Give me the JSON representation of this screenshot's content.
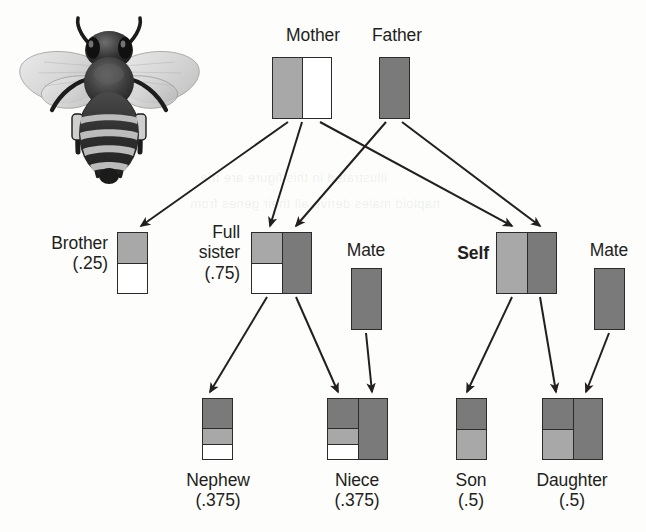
{
  "figure": {
    "background_color": "#fdfdfc",
    "line_color": "#231f20"
  },
  "palette": {
    "white": "#ffffff",
    "light_gray": "#a8a8a8",
    "dark_gray": "#7a7a7a",
    "outline": "#2b2b2b"
  },
  "ghost_text": [
    {
      "text": "illustrated in this figure are the",
      "x": 200,
      "y": 170
    },
    {
      "text": "haploid males derive all their genes from",
      "x": 190,
      "y": 196
    }
  ],
  "bee": {
    "name": "honeybee-illustration",
    "alt": "Grayscale honeybee viewed from above with wings spread"
  },
  "nodes": [
    {
      "id": "mother",
      "label": "Mother",
      "coefficient": "",
      "bold": false,
      "label_x": 313,
      "label_y": 25,
      "label_align": "center",
      "block_x": 272,
      "block_y": 57,
      "block_w": 60,
      "block_h": 62,
      "columns": [
        {
          "cells": [
            {
              "fill": "light_gray",
              "frac": 1
            }
          ]
        },
        {
          "cells": [
            {
              "fill": "white",
              "frac": 1
            }
          ]
        }
      ]
    },
    {
      "id": "father",
      "label": "Father",
      "coefficient": "",
      "bold": false,
      "label_x": 397,
      "label_y": 25,
      "label_align": "center",
      "block_x": 379,
      "block_y": 57,
      "block_w": 31,
      "block_h": 62,
      "columns": [
        {
          "cells": [
            {
              "fill": "dark_gray",
              "frac": 1
            }
          ]
        }
      ]
    },
    {
      "id": "brother",
      "label": "Brother",
      "coefficient": "(.25)",
      "bold": false,
      "label_x": 108,
      "label_y": 233,
      "label_align": "right",
      "block_x": 117,
      "block_y": 232,
      "block_w": 31,
      "block_h": 62,
      "columns": [
        {
          "cells": [
            {
              "fill": "light_gray",
              "frac": 0.5
            },
            {
              "fill": "white",
              "frac": 0.5
            }
          ]
        }
      ]
    },
    {
      "id": "full-sister",
      "label": "Full\nsister",
      "coefficient": "(.75)",
      "bold": false,
      "label_x": 240,
      "label_y": 222,
      "label_align": "right",
      "block_x": 251,
      "block_y": 232,
      "block_w": 61,
      "block_h": 62,
      "columns": [
        {
          "cells": [
            {
              "fill": "light_gray",
              "frac": 0.5
            },
            {
              "fill": "white",
              "frac": 0.5
            }
          ]
        },
        {
          "cells": [
            {
              "fill": "dark_gray",
              "frac": 1
            }
          ]
        }
      ]
    },
    {
      "id": "mate-left",
      "label": "Mate",
      "coefficient": "",
      "bold": false,
      "label_x": 366,
      "label_y": 240,
      "label_align": "center",
      "block_x": 351,
      "block_y": 268,
      "block_w": 31,
      "block_h": 62,
      "columns": [
        {
          "cells": [
            {
              "fill": "dark_gray",
              "frac": 1
            }
          ]
        }
      ]
    },
    {
      "id": "self",
      "label": "Self",
      "coefficient": "",
      "bold": true,
      "label_x": 489,
      "label_y": 243,
      "label_align": "right",
      "block_x": 496,
      "block_y": 232,
      "block_w": 61,
      "block_h": 62,
      "columns": [
        {
          "cells": [
            {
              "fill": "light_gray",
              "frac": 1
            }
          ]
        },
        {
          "cells": [
            {
              "fill": "dark_gray",
              "frac": 1
            }
          ]
        }
      ]
    },
    {
      "id": "mate-right",
      "label": "Mate",
      "coefficient": "",
      "bold": false,
      "label_x": 609,
      "label_y": 240,
      "label_align": "center",
      "block_x": 594,
      "block_y": 268,
      "block_w": 31,
      "block_h": 62,
      "columns": [
        {
          "cells": [
            {
              "fill": "dark_gray",
              "frac": 1
            }
          ]
        }
      ]
    },
    {
      "id": "nephew",
      "label": "Nephew",
      "coefficient": "(.375)",
      "bold": false,
      "label_x": 218,
      "label_y": 470,
      "label_align": "center",
      "block_x": 202,
      "block_y": 398,
      "block_w": 31,
      "block_h": 62,
      "columns": [
        {
          "cells": [
            {
              "fill": "dark_gray",
              "frac": 0.5
            },
            {
              "fill": "light_gray",
              "frac": 0.25
            },
            {
              "fill": "white",
              "frac": 0.25
            }
          ]
        }
      ]
    },
    {
      "id": "niece",
      "label": "Niece",
      "coefficient": "(.375)",
      "bold": false,
      "label_x": 357,
      "label_y": 470,
      "label_align": "center",
      "block_x": 327,
      "block_y": 398,
      "block_w": 61,
      "block_h": 62,
      "columns": [
        {
          "cells": [
            {
              "fill": "dark_gray",
              "frac": 0.5
            },
            {
              "fill": "light_gray",
              "frac": 0.25
            },
            {
              "fill": "white",
              "frac": 0.25
            }
          ]
        },
        {
          "cells": [
            {
              "fill": "dark_gray",
              "frac": 1
            }
          ]
        }
      ]
    },
    {
      "id": "son",
      "label": "Son",
      "coefficient": "(.5)",
      "bold": false,
      "label_x": 471,
      "label_y": 470,
      "label_align": "center",
      "block_x": 456,
      "block_y": 398,
      "block_w": 31,
      "block_h": 62,
      "columns": [
        {
          "cells": [
            {
              "fill": "dark_gray",
              "frac": 0.5
            },
            {
              "fill": "light_gray",
              "frac": 0.5
            }
          ]
        }
      ]
    },
    {
      "id": "daughter",
      "label": "Daughter",
      "coefficient": "(.5)",
      "bold": false,
      "label_x": 572,
      "label_y": 470,
      "label_align": "center",
      "block_x": 542,
      "block_y": 398,
      "block_w": 61,
      "block_h": 62,
      "columns": [
        {
          "cells": [
            {
              "fill": "dark_gray",
              "frac": 0.5
            },
            {
              "fill": "light_gray",
              "frac": 0.5
            }
          ]
        },
        {
          "cells": [
            {
              "fill": "dark_gray",
              "frac": 1
            }
          ]
        }
      ]
    }
  ],
  "arrows": [
    {
      "from": "mother",
      "to": "brother",
      "x1": 288,
      "y1": 122,
      "x2": 141,
      "y2": 226
    },
    {
      "from": "mother",
      "to": "full-sister",
      "x1": 302,
      "y1": 122,
      "x2": 270,
      "y2": 226
    },
    {
      "from": "mother",
      "to": "self",
      "x1": 320,
      "y1": 122,
      "x2": 512,
      "y2": 226
    },
    {
      "from": "father",
      "to": "full-sister",
      "x1": 386,
      "y1": 122,
      "x2": 296,
      "y2": 226
    },
    {
      "from": "father",
      "to": "self",
      "x1": 402,
      "y1": 122,
      "x2": 540,
      "y2": 226
    },
    {
      "from": "full-sister",
      "to": "nephew",
      "x1": 267,
      "y1": 297,
      "x2": 210,
      "y2": 392
    },
    {
      "from": "full-sister",
      "to": "niece",
      "x1": 296,
      "y1": 297,
      "x2": 338,
      "y2": 392
    },
    {
      "from": "mate-left",
      "to": "niece",
      "x1": 366,
      "y1": 333,
      "x2": 372,
      "y2": 392
    },
    {
      "from": "self",
      "to": "son",
      "x1": 512,
      "y1": 297,
      "x2": 467,
      "y2": 392
    },
    {
      "from": "self",
      "to": "daughter",
      "x1": 540,
      "y1": 297,
      "x2": 556,
      "y2": 392
    },
    {
      "from": "mate-right",
      "to": "daughter",
      "x1": 609,
      "y1": 333,
      "x2": 586,
      "y2": 392
    }
  ]
}
